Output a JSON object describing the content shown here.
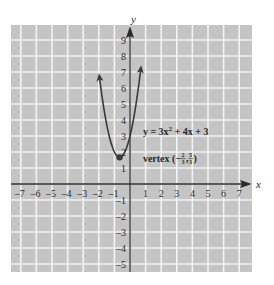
{
  "chart_data": {
    "type": "line",
    "title": "",
    "xlabel": "x",
    "ylabel": "y",
    "xlim": [
      -7.5,
      7.8
    ],
    "ylim": [
      -5.6,
      9.6
    ],
    "grid": true,
    "colors": {
      "background": "#c4c4c4",
      "grid": "#f2f2f2",
      "axis": "#2a2a2a",
      "curve": "#3a3a3a",
      "text": "#2a2a2a"
    },
    "x_ticks": [
      -7,
      -6,
      -5,
      -4,
      -3,
      -2,
      -1,
      1,
      2,
      3,
      4,
      5,
      6,
      7
    ],
    "y_ticks": [
      -5,
      -4,
      -3,
      -2,
      -1,
      1,
      2,
      3,
      4,
      5,
      6,
      7,
      8,
      9
    ],
    "series": [
      {
        "name": "y = 3x^2 + 4x + 3",
        "equation": {
          "a": 3,
          "b": 4,
          "c": 3
        },
        "x_range": [
          -1.95,
          0.68
        ],
        "arrows_at_ends": true
      }
    ],
    "points": [
      {
        "name": "vertex",
        "x": -0.6667,
        "y": 1.6667
      }
    ],
    "annotations": {
      "equation": {
        "prefix": "y = 3x",
        "sup": "2",
        "suffix": " + 4x + 3",
        "x": 0.7,
        "y": 3.3
      },
      "vertex": {
        "prefix": "vertex (−",
        "frac1_num": "2",
        "frac1_den": "3",
        "sep": ", ",
        "frac2_num": "5",
        "frac2_den": "3",
        "suffix": ")",
        "x": 0.7,
        "y": 1.6
      }
    }
  }
}
